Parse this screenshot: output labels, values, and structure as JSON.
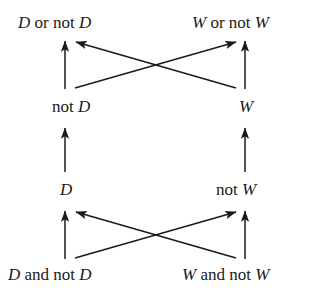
{
  "diagram": {
    "type": "implication-lattice",
    "background_color": "#ffffff",
    "line_color": "#1a1a1a",
    "nodes": [
      {
        "id": "top-left",
        "row": 1,
        "column": "left",
        "text": "D or not D",
        "var": "D",
        "parts": [
          "D",
          " or not ",
          "D"
        ]
      },
      {
        "id": "top-right",
        "row": 1,
        "column": "right",
        "text": "W or not W",
        "var": "W",
        "parts": [
          "W",
          " or not ",
          "W"
        ]
      },
      {
        "id": "mid-left",
        "row": 2,
        "column": "left",
        "text": "not D",
        "var": "D",
        "parts": [
          "not ",
          "D"
        ]
      },
      {
        "id": "mid-right",
        "row": 2,
        "column": "right",
        "text": "W",
        "var": "W",
        "parts": [
          "W"
        ]
      },
      {
        "id": "lower-left",
        "row": 3,
        "column": "left",
        "text": "D",
        "var": "D",
        "parts": [
          "D"
        ]
      },
      {
        "id": "lower-right",
        "row": 3,
        "column": "right",
        "text": "not W",
        "var": "W",
        "parts": [
          "not ",
          "W"
        ]
      },
      {
        "id": "bot-left",
        "row": 4,
        "column": "left",
        "text": "D and not D",
        "var": "D",
        "parts": [
          "D",
          " and not ",
          "D"
        ]
      },
      {
        "id": "bot-right",
        "row": 4,
        "column": "right",
        "text": "W and not W",
        "var": "W",
        "parts": [
          "W",
          " and not ",
          "W"
        ]
      }
    ],
    "labels": {
      "top_left": "D or not D",
      "top_right": "W or not W",
      "mid_left": "not D",
      "mid_right": "W",
      "lower_left": "D",
      "lower_right": "not W",
      "bottom_left": "D and not D",
      "bottom_right": "W and not W",
      "top_left_var_1": "D",
      "top_left_op": " or not ",
      "top_left_var_2": "D",
      "top_right_var_1": "W",
      "top_right_op": " or not ",
      "top_right_var_2": "W",
      "mid_left_op": "not ",
      "mid_left_var": "D",
      "mid_right_var": "W",
      "lower_left_var": "D",
      "lower_right_op": "not ",
      "lower_right_var": "W",
      "bottom_left_var_1": "D",
      "bottom_left_op": " and not ",
      "bottom_left_var_2": "D",
      "bottom_right_var_1": "W",
      "bottom_right_op": " and not ",
      "bottom_right_var_2": "W"
    },
    "edges": [
      {
        "id": "e1",
        "from": "mid-left",
        "to": "top-left",
        "style": "vertical"
      },
      {
        "id": "e2",
        "from": "mid-right",
        "to": "top-right",
        "style": "vertical"
      },
      {
        "id": "e3",
        "from": "mid-left",
        "to": "top-right",
        "style": "diagonal"
      },
      {
        "id": "e4",
        "from": "mid-right",
        "to": "top-left",
        "style": "diagonal"
      },
      {
        "id": "e5",
        "from": "lower-left",
        "to": "mid-left",
        "style": "vertical"
      },
      {
        "id": "e6",
        "from": "lower-right",
        "to": "mid-right",
        "style": "vertical"
      },
      {
        "id": "e7",
        "from": "bot-left",
        "to": "lower-left",
        "style": "vertical"
      },
      {
        "id": "e8",
        "from": "bot-right",
        "to": "lower-right",
        "style": "vertical"
      },
      {
        "id": "e9",
        "from": "bot-left",
        "to": "lower-right",
        "style": "diagonal"
      },
      {
        "id": "e10",
        "from": "bot-right",
        "to": "lower-left",
        "style": "diagonal"
      }
    ]
  }
}
